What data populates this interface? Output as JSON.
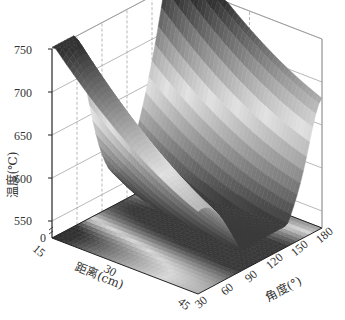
{
  "chart_data": {
    "type": "surface3d",
    "title": "",
    "xlabel": "距离(cm)",
    "ylabel": "角度(°)",
    "zlabel": "温度(℃)",
    "x_axis": {
      "name": "distance_cm",
      "ticks": [
        15,
        30,
        45
      ],
      "range": [
        15,
        45
      ]
    },
    "y_axis": {
      "name": "angle_deg",
      "ticks": [
        30,
        60,
        90,
        120,
        150,
        180
      ],
      "range": [
        30,
        180
      ]
    },
    "z_axis": {
      "ticks": [
        0,
        550,
        600,
        650,
        700,
        750
      ],
      "range": [
        550,
        750
      ],
      "broken_axis_at_bottom": true
    },
    "floor_projection": "filled contour map (grayscale)",
    "colormap": "grayscale (dark = high/low extremes, light = mid)",
    "grid": true,
    "legend": null,
    "surface_description": "Saddle-like temperature surface: minimum ~560 ℃ near distance≈40 cm, angle≈90–110°; high ridges ~735–750 ℃ along distance=15 cm at angle≈60 and along angle=180 near distance 30–45 cm; peak ~745 ℃ at back corner (distance 15, angle 180).",
    "sample_points": [
      {
        "distance": 15,
        "angle": 30,
        "temp": 735
      },
      {
        "distance": 15,
        "angle": 60,
        "temp": 745
      },
      {
        "distance": 15,
        "angle": 120,
        "temp": 700
      },
      {
        "distance": 15,
        "angle": 180,
        "temp": 748
      },
      {
        "distance": 30,
        "angle": 30,
        "temp": 640
      },
      {
        "distance": 30,
        "angle": 90,
        "temp": 600
      },
      {
        "distance": 30,
        "angle": 180,
        "temp": 690
      },
      {
        "distance": 45,
        "angle": 30,
        "temp": 690
      },
      {
        "distance": 45,
        "angle": 90,
        "temp": 575
      },
      {
        "distance": 45,
        "angle": 110,
        "temp": 560
      },
      {
        "distance": 45,
        "angle": 150,
        "temp": 660
      },
      {
        "distance": 45,
        "angle": 180,
        "temp": 730
      }
    ]
  },
  "labels": {
    "z_title": "温度(℃)",
    "x_title": "距离(cm)",
    "y_title": "角度(°)",
    "z_ticks": [
      "750",
      "700",
      "650",
      "600",
      "550",
      "0"
    ],
    "x_ticks": [
      "15",
      "30",
      "45"
    ],
    "y_ticks": [
      "30",
      "60",
      "90",
      "120",
      "150",
      "180"
    ]
  }
}
